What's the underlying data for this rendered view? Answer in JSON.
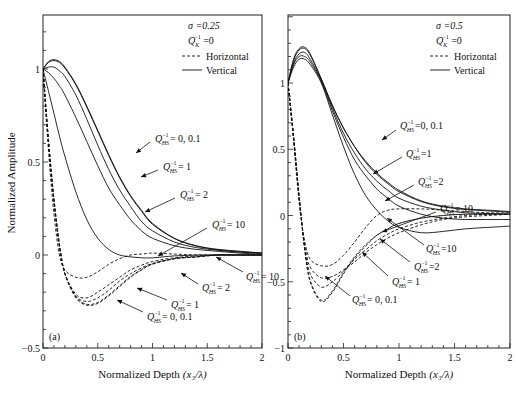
{
  "figure": {
    "ylabel": "Normalized Amplitude",
    "panels": [
      {
        "id": "a",
        "tag": "(a)",
        "xlabel": "Normalized Depth (x₃/λ)",
        "xlabel_main": "Normalized Depth",
        "xlabel_var": "(x₃/λ)",
        "frame": {
          "x0": 43,
          "x1": 262,
          "y_top": 15,
          "y_bottom": 348
        },
        "xlim": [
          0,
          2
        ],
        "ylim": [
          -0.5,
          1.3
        ],
        "yscale": {
          "v1": 1,
          "p1": 69,
          "v2": -0.5,
          "p2": 348
        },
        "xticks": [
          0,
          0.5,
          1,
          1.5,
          2
        ],
        "xtick_labels": [
          "0",
          "0.5",
          "1",
          "1.5",
          "2"
        ],
        "yticks": [
          -0.5,
          0,
          0.5,
          1
        ],
        "ytick_labels": [
          "−0.5",
          "0",
          "0.5",
          "1"
        ],
        "legend": {
          "sigma": "σ =0.25",
          "qk": "Q",
          "qk_sub": "K",
          "qk_sup": "−1",
          "qk_val": " =0",
          "horizontal": "Horizontal",
          "vertical": "Vertical"
        },
        "annotations": [
          {
            "text": "= 0, 0.1",
            "x": 155,
            "y": 142,
            "ax": 150,
            "ay": 142,
            "tx": 136,
            "ty": 153
          },
          {
            "text": "= 1",
            "x": 163,
            "y": 170,
            "ax": 158,
            "ay": 170,
            "tx": 141,
            "ty": 177
          },
          {
            "text": "= 2",
            "x": 180,
            "y": 198,
            "ax": 175,
            "ay": 198,
            "tx": 145,
            "ty": 212
          },
          {
            "text": "= 10",
            "x": 212,
            "y": 228,
            "ax": 207,
            "ay": 228,
            "tx": 158,
            "ty": 256
          },
          {
            "text": "= 10",
            "x": 246,
            "y": 280,
            "ax": 243,
            "ay": 272,
            "tx": 216,
            "ty": 257
          },
          {
            "text": "= 2",
            "x": 202,
            "y": 291,
            "ax": 198,
            "ay": 284,
            "tx": 181,
            "ty": 273
          },
          {
            "text": "= 1",
            "x": 171,
            "y": 308,
            "ax": 167,
            "ay": 300,
            "tx": 137,
            "ty": 288
          },
          {
            "text": "= 0, 0.1",
            "x": 147,
            "y": 320,
            "ax": 143,
            "ay": 312,
            "tx": 117,
            "ty": 300
          }
        ]
      },
      {
        "id": "b",
        "tag": "(b)",
        "xlabel": "Normalized Depth (x₃/λ)",
        "xlabel_main": "Normalized Depth",
        "xlabel_var": "(x₃/λ)",
        "frame": {
          "x0": 288,
          "x1": 510,
          "y_top": 15,
          "y_bottom": 348
        },
        "xlim": [
          0,
          2
        ],
        "ylim": [
          -1,
          1.5
        ],
        "yscale": {
          "v1": 1,
          "p1": 83,
          "v2": -1,
          "p2": 348
        },
        "xticks": [
          0,
          0.5,
          1,
          1.5,
          2
        ],
        "xtick_labels": [
          "0",
          "0.5",
          "1",
          "1.5",
          "2"
        ],
        "yticks": [
          -1,
          -0.5,
          0,
          0.5,
          1
        ],
        "ytick_labels": [
          "−1",
          "−0.5",
          "0",
          "0.5",
          "1"
        ],
        "legend": {
          "sigma": "σ =0.5",
          "qk": "Q",
          "qk_sub": "K",
          "qk_sup": "−1",
          "qk_val": " =0",
          "horizontal": "Horizontal",
          "vertical": "Vertical"
        },
        "annotations": [
          {
            "text": "=0, 0.1",
            "x": 400,
            "y": 129,
            "ax": 396,
            "ay": 130,
            "tx": 382,
            "ty": 140
          },
          {
            "text": "=1",
            "x": 406,
            "y": 157,
            "ax": 402,
            "ay": 157,
            "tx": 373,
            "ty": 174
          },
          {
            "text": "=2",
            "x": 418,
            "y": 185,
            "ax": 414,
            "ay": 185,
            "tx": 385,
            "ty": 201
          },
          {
            "text": "= 10",
            "x": 440,
            "y": 212,
            "ax": 436,
            "ay": 212,
            "tx": 382,
            "ty": 232
          },
          {
            "text": "=10",
            "x": 426,
            "y": 252,
            "ax": 424,
            "ay": 245,
            "tx": 387,
            "ty": 218
          },
          {
            "text": "=2",
            "x": 414,
            "y": 270,
            "ax": 410,
            "ay": 262,
            "tx": 380,
            "ty": 239
          },
          {
            "text": "= 1",
            "x": 392,
            "y": 285,
            "ax": 388,
            "ay": 276,
            "tx": 362,
            "ty": 252
          },
          {
            "text": "= 0, 0.1",
            "x": 352,
            "y": 303,
            "ax": 350,
            "ay": 296,
            "tx": 325,
            "ty": 276
          }
        ]
      }
    ]
  },
  "chart_data": [
    {
      "type": "line",
      "title": "(a) σ = 0.25, Q_K^-1 = 0",
      "xlabel": "Normalized Depth (x3/λ)",
      "ylabel": "Normalized Amplitude",
      "xlim": [
        0,
        2
      ],
      "ylim": [
        -0.5,
        1.3
      ],
      "grid": false,
      "legend": [
        "Horizontal (dashed)",
        "Vertical (solid)"
      ],
      "legend_position": "upper right",
      "x": [
        0,
        0.05,
        0.1,
        0.15,
        0.2,
        0.3,
        0.4,
        0.5,
        0.6,
        0.7,
        0.8,
        0.9,
        1.0,
        1.2,
        1.4,
        1.6,
        1.8,
        2.0
      ],
      "series": [
        {
          "name": "Vertical Q_HS^-1=0",
          "style": "solid",
          "values": [
            1.0,
            1.04,
            1.05,
            1.04,
            1.01,
            0.92,
            0.8,
            0.67,
            0.54,
            0.42,
            0.32,
            0.24,
            0.17,
            0.09,
            0.05,
            0.03,
            0.02,
            0.01
          ]
        },
        {
          "name": "Vertical Q_HS^-1=0.1",
          "style": "solid",
          "values": [
            1.0,
            1.035,
            1.045,
            1.035,
            1.005,
            0.915,
            0.795,
            0.665,
            0.535,
            0.415,
            0.315,
            0.235,
            0.165,
            0.088,
            0.048,
            0.028,
            0.018,
            0.01
          ]
        },
        {
          "name": "Vertical Q_HS^-1=1",
          "style": "solid",
          "values": [
            1.0,
            1.01,
            1.01,
            0.99,
            0.96,
            0.86,
            0.73,
            0.59,
            0.46,
            0.35,
            0.26,
            0.18,
            0.13,
            0.07,
            0.04,
            0.025,
            0.015,
            0.01
          ]
        },
        {
          "name": "Vertical Q_HS^-1=2",
          "style": "solid",
          "values": [
            1.0,
            0.98,
            0.95,
            0.91,
            0.86,
            0.74,
            0.61,
            0.48,
            0.36,
            0.27,
            0.19,
            0.13,
            0.09,
            0.05,
            0.03,
            0.02,
            0.01,
            0.005
          ]
        },
        {
          "name": "Vertical Q_HS^-1=10",
          "style": "solid",
          "values": [
            1.0,
            0.88,
            0.76,
            0.64,
            0.53,
            0.34,
            0.19,
            0.09,
            0.03,
            0.0,
            -0.01,
            -0.015,
            -0.015,
            -0.005,
            0.0,
            0.0,
            0.0,
            0.0
          ]
        },
        {
          "name": "Horizontal Q_HS^-1=0",
          "style": "dashed",
          "values": [
            1.0,
            0.62,
            0.3,
            0.06,
            -0.1,
            -0.23,
            -0.27,
            -0.26,
            -0.22,
            -0.17,
            -0.12,
            -0.08,
            -0.05,
            -0.02,
            -0.01,
            0.0,
            0.0,
            0.0
          ]
        },
        {
          "name": "Horizontal Q_HS^-1=0.1",
          "style": "dashed",
          "values": [
            1.0,
            0.62,
            0.3,
            0.06,
            -0.1,
            -0.225,
            -0.265,
            -0.255,
            -0.215,
            -0.165,
            -0.115,
            -0.078,
            -0.048,
            -0.02,
            -0.01,
            0.0,
            0.0,
            0.0
          ]
        },
        {
          "name": "Horizontal Q_HS^-1=1",
          "style": "dashed",
          "values": [
            1.0,
            0.61,
            0.29,
            0.05,
            -0.1,
            -0.22,
            -0.25,
            -0.23,
            -0.19,
            -0.14,
            -0.1,
            -0.07,
            -0.045,
            -0.02,
            -0.01,
            0.0,
            0.0,
            0.0
          ]
        },
        {
          "name": "Horizontal Q_HS^-1=2",
          "style": "dashed",
          "values": [
            1.0,
            0.6,
            0.28,
            0.04,
            -0.1,
            -0.21,
            -0.23,
            -0.2,
            -0.16,
            -0.12,
            -0.08,
            -0.055,
            -0.035,
            -0.015,
            -0.005,
            0.0,
            0.0,
            0.0
          ]
        },
        {
          "name": "Horizontal Q_HS^-1=10",
          "style": "dashed",
          "values": [
            1.0,
            0.56,
            0.22,
            0.0,
            -0.08,
            -0.12,
            -0.12,
            -0.09,
            -0.05,
            -0.02,
            0.0,
            0.005,
            0.01,
            0.005,
            0.0,
            0.0,
            0.0,
            0.0
          ]
        }
      ]
    },
    {
      "type": "line",
      "title": "(b) σ = 0.5, Q_K^-1 = 0",
      "xlabel": "Normalized Depth (x3/λ)",
      "ylabel": "Normalized Amplitude",
      "xlim": [
        0,
        2
      ],
      "ylim": [
        -1,
        1.5
      ],
      "grid": false,
      "legend": [
        "Horizontal (dashed)",
        "Vertical (solid)"
      ],
      "legend_position": "upper right",
      "x": [
        0,
        0.05,
        0.1,
        0.15,
        0.2,
        0.3,
        0.4,
        0.5,
        0.6,
        0.7,
        0.8,
        0.9,
        1.0,
        1.2,
        1.4,
        1.6,
        1.8,
        2.0
      ],
      "series": [
        {
          "name": "Vertical Q_HS^-1=0",
          "style": "solid",
          "values": [
            1.0,
            1.18,
            1.26,
            1.27,
            1.22,
            1.03,
            0.83,
            0.66,
            0.52,
            0.41,
            0.32,
            0.25,
            0.19,
            0.11,
            0.07,
            0.05,
            0.04,
            0.03
          ]
        },
        {
          "name": "Vertical Q_HS^-1=0.1",
          "style": "solid",
          "values": [
            1.0,
            1.17,
            1.25,
            1.26,
            1.21,
            1.03,
            0.83,
            0.66,
            0.52,
            0.4,
            0.31,
            0.24,
            0.18,
            0.105,
            0.065,
            0.045,
            0.035,
            0.025
          ]
        },
        {
          "name": "Vertical Q_HS^-1=1",
          "style": "solid",
          "values": [
            1.0,
            1.15,
            1.22,
            1.23,
            1.18,
            1.02,
            0.81,
            0.62,
            0.47,
            0.35,
            0.26,
            0.19,
            0.13,
            0.07,
            0.04,
            0.02,
            0.015,
            0.01
          ]
        },
        {
          "name": "Vertical Q_HS^-1=2",
          "style": "solid",
          "values": [
            1.0,
            1.14,
            1.2,
            1.2,
            1.16,
            1.01,
            0.79,
            0.59,
            0.42,
            0.3,
            0.2,
            0.13,
            0.07,
            0.01,
            -0.02,
            -0.03,
            -0.03,
            -0.03
          ]
        },
        {
          "name": "Vertical Q_HS^-1=10",
          "style": "solid",
          "values": [
            1.0,
            1.12,
            1.18,
            1.18,
            1.14,
            1.0,
            0.76,
            0.52,
            0.31,
            0.15,
            0.04,
            -0.04,
            -0.09,
            -0.13,
            -0.12,
            -0.1,
            -0.09,
            -0.08
          ]
        },
        {
          "name": "Horizontal Q_HS^-1=0",
          "style": "dashed",
          "values": [
            1.0,
            0.6,
            0.15,
            -0.25,
            -0.5,
            -0.65,
            -0.58,
            -0.44,
            -0.32,
            -0.23,
            -0.15,
            -0.1,
            -0.06,
            -0.02,
            0.0,
            0.01,
            0.01,
            0.01
          ]
        },
        {
          "name": "Horizontal Q_HS^-1=0.1",
          "style": "dashed",
          "values": [
            1.0,
            0.6,
            0.15,
            -0.25,
            -0.49,
            -0.64,
            -0.57,
            -0.43,
            -0.31,
            -0.22,
            -0.15,
            -0.1,
            -0.06,
            -0.02,
            0.0,
            0.01,
            0.01,
            0.01
          ]
        },
        {
          "name": "Horizontal Q_HS^-1=1",
          "style": "dashed",
          "values": [
            1.0,
            0.59,
            0.14,
            -0.24,
            -0.44,
            -0.54,
            -0.5,
            -0.42,
            -0.33,
            -0.26,
            -0.19,
            -0.14,
            -0.1,
            -0.05,
            -0.02,
            0.0,
            0.01,
            0.01
          ]
        },
        {
          "name": "Horizontal Q_HS^-1=2",
          "style": "dashed",
          "values": [
            1.0,
            0.58,
            0.13,
            -0.22,
            -0.39,
            -0.47,
            -0.46,
            -0.41,
            -0.35,
            -0.28,
            -0.22,
            -0.17,
            -0.13,
            -0.07,
            -0.03,
            -0.01,
            0.0,
            0.01
          ]
        },
        {
          "name": "Horizontal Q_HS^-1=10",
          "style": "dashed",
          "values": [
            1.0,
            0.56,
            0.1,
            -0.19,
            -0.33,
            -0.38,
            -0.37,
            -0.3,
            -0.2,
            -0.09,
            0.0,
            0.04,
            0.05,
            0.05,
            0.04,
            0.03,
            0.02,
            0.02
          ]
        }
      ]
    }
  ]
}
